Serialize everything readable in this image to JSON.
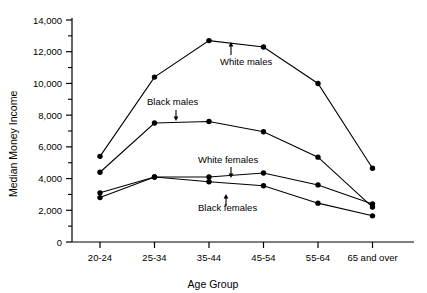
{
  "chart_data": {
    "type": "line",
    "title": "",
    "subtitle": "",
    "xlabel": "Age Group",
    "ylabel": "Median Money Income",
    "categories": [
      "20-24",
      "25-34",
      "35-44",
      "45-54",
      "55-64",
      "65 and over"
    ],
    "ylim": [
      0,
      14000
    ],
    "ytick_values": [
      0,
      2000,
      4000,
      6000,
      8000,
      10000,
      12000,
      14000
    ],
    "ytick_labels": [
      "0",
      "2,000",
      "4,000",
      "6,000",
      "8,000",
      "10,000",
      "12,000",
      "14,000"
    ],
    "yminor_step": 1000,
    "grid": false,
    "legend": "inline-annotations",
    "marker": "filled-circle",
    "series": [
      {
        "name": "White males",
        "values": [
          5400,
          10400,
          12700,
          12300,
          10000,
          4650
        ],
        "color": "#000000",
        "annotation": {
          "label": "White males",
          "label_x": 220,
          "label_y": 65,
          "arrow_x": 231,
          "arrow_y_from": 55,
          "arrow_y_to": 42
        }
      },
      {
        "name": "Black males",
        "values": [
          4400,
          7500,
          7600,
          6950,
          5350,
          2200
        ],
        "color": "#000000",
        "annotation": {
          "label": "Black males",
          "label_x": 147,
          "label_y": 105,
          "arrow_x": 176,
          "arrow_y_from": 110,
          "arrow_y_to": 121
        }
      },
      {
        "name": "White females",
        "values": [
          3100,
          4100,
          4100,
          4350,
          3600,
          2400
        ],
        "color": "#000000",
        "annotation": {
          "label": "White females",
          "label_x": 198,
          "label_y": 163,
          "arrow_x": 231,
          "arrow_y_from": 167,
          "arrow_y_to": 178
        }
      },
      {
        "name": "Black females",
        "values": [
          2800,
          4100,
          3800,
          3550,
          2450,
          1650
        ],
        "color": "#000000",
        "annotation": {
          "label": "Black females",
          "label_x": 198,
          "label_y": 211,
          "arrow_x": 226,
          "arrow_y_from": 206,
          "arrow_y_to": 194
        }
      }
    ]
  },
  "axes": {
    "y_axis_title": "Median Money Income",
    "x_axis_title": "Age Group"
  }
}
